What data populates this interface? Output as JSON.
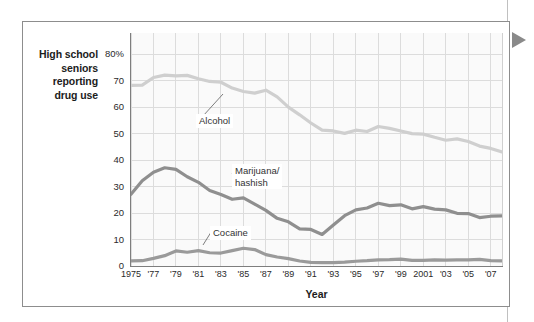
{
  "figure": {
    "y_axis_caption": "High school\nseniors\nreporting\ndrug use",
    "x_axis_title": "Year",
    "marker_icon": "right-triangle-icon",
    "colors": {
      "alcohol": "#cfcfcf",
      "marijuana": "#8f8f8f",
      "cocaine": "#9a9a9a",
      "grid": "#dcdcdc",
      "axis": "#7e7e7e",
      "plot_background": "#fafafa",
      "marker": "#8a8a8a",
      "border": "#8d8d8d"
    }
  },
  "chart_data": {
    "type": "line",
    "title": "",
    "xlabel": "Year",
    "ylabel": "High school seniors reporting drug use",
    "ylim": [
      0,
      88
    ],
    "xlim": [
      1975,
      2008
    ],
    "grid": true,
    "legend": "inline-callout-labels",
    "ytick_labels": [
      "0",
      "10",
      "20",
      "30",
      "40",
      "50",
      "60",
      "70",
      "80%"
    ],
    "ytick_values": [
      0,
      10,
      20,
      30,
      40,
      50,
      60,
      70,
      80
    ],
    "xtick_labels": [
      "1975",
      "'77",
      "'79",
      "'81",
      "'83",
      "'85",
      "'87",
      "'89",
      "'91",
      "'93",
      "'95",
      "'97",
      "'99",
      "2001",
      "'03",
      "'05",
      "'07"
    ],
    "xtick_values": [
      1975,
      1977,
      1979,
      1981,
      1983,
      1985,
      1987,
      1989,
      1991,
      1993,
      1995,
      1997,
      1999,
      2001,
      2003,
      2005,
      2007
    ],
    "x": [
      1975,
      1976,
      1977,
      1978,
      1979,
      1980,
      1981,
      1982,
      1983,
      1984,
      1985,
      1986,
      1987,
      1988,
      1989,
      1990,
      1991,
      1992,
      1993,
      1994,
      1995,
      1996,
      1997,
      1998,
      1999,
      2000,
      2001,
      2002,
      2003,
      2004,
      2005,
      2006,
      2007,
      2008
    ],
    "series": [
      {
        "name": "Alcohol",
        "label": "Alcohol",
        "color": "#cfcfcf",
        "values": [
          68.2,
          68.3,
          71.2,
          72.1,
          71.8,
          72.0,
          70.7,
          69.7,
          69.4,
          67.2,
          65.9,
          65.3,
          66.4,
          63.9,
          60.0,
          57.1,
          54.0,
          51.3,
          51.0,
          50.1,
          51.3,
          50.8,
          52.7,
          52.0,
          51.0,
          50.0,
          49.8,
          48.6,
          47.5,
          48.0,
          47.0,
          45.3,
          44.4,
          43.1
        ]
      },
      {
        "name": "Marijuana/hashish",
        "label": "Marijuana/\nhashish",
        "color": "#8f8f8f",
        "values": [
          27.1,
          32.2,
          35.4,
          37.1,
          36.5,
          33.7,
          31.6,
          28.5,
          27.0,
          25.2,
          25.7,
          23.4,
          21.0,
          18.0,
          16.7,
          14.0,
          13.8,
          11.9,
          15.5,
          19.0,
          21.2,
          21.9,
          23.7,
          22.8,
          23.1,
          21.6,
          22.4,
          21.5,
          21.2,
          19.9,
          19.8,
          18.3,
          18.8,
          18.9
        ]
      },
      {
        "name": "Cocaine",
        "label": "Cocaine",
        "color": "#9a9a9a",
        "values": [
          1.9,
          2.0,
          2.9,
          3.9,
          5.7,
          5.2,
          5.8,
          5.0,
          4.9,
          5.8,
          6.7,
          6.2,
          4.3,
          3.4,
          2.8,
          1.9,
          1.4,
          1.3,
          1.3,
          1.5,
          1.8,
          2.0,
          2.3,
          2.4,
          2.6,
          2.1,
          2.1,
          2.3,
          2.2,
          2.3,
          2.3,
          2.5,
          2.0,
          1.9
        ]
      }
    ],
    "annotations": [
      {
        "label": "Alcohol",
        "x": 1983,
        "y": 60
      },
      {
        "label": "Marijuana/hashish",
        "x": 1986,
        "y": 36
      },
      {
        "label": "Cocaine",
        "x": 1983,
        "y": 13
      }
    ]
  }
}
